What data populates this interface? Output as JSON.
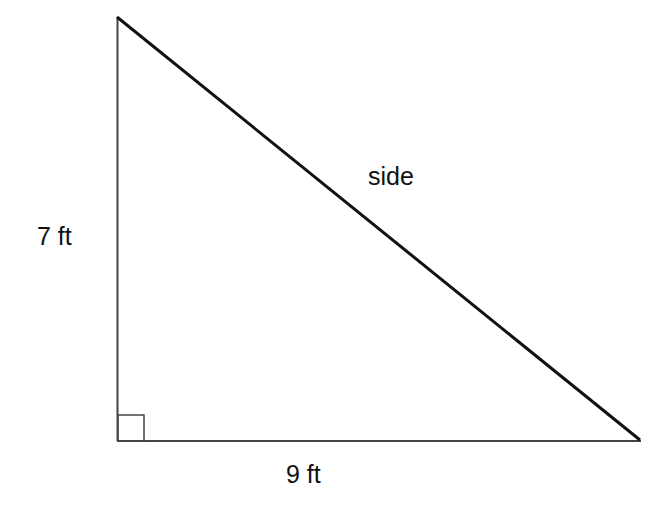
{
  "diagram": {
    "type": "right-triangle",
    "vertices": {
      "top": [
        117,
        17
      ],
      "right_angle": [
        118,
        441
      ],
      "right": [
        640,
        440
      ]
    },
    "labels": {
      "vertical_leg": "7 ft",
      "horizontal_leg": "9 ft",
      "hypotenuse": "side"
    },
    "right_angle_marker": true,
    "colors": {
      "stroke": "#1a1a1a",
      "text": "#111111",
      "background": "#ffffff"
    }
  }
}
